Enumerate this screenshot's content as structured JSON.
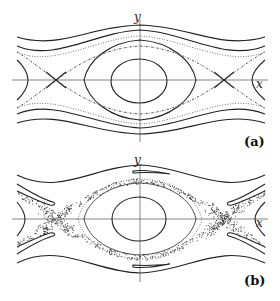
{
  "figure": {
    "panels": [
      {
        "id": "a",
        "label": "(a)",
        "x_axis_label": "x",
        "y_axis_label": "y",
        "features": [
          "central elliptic orbit",
          "separatrix with X-points",
          "rotational orbits above and below",
          "dotted near-separatrix orbits"
        ]
      },
      {
        "id": "b",
        "label": "(b)",
        "x_axis_label": "x",
        "y_axis_label": "y",
        "features": [
          "central elliptic orbit",
          "dotted invariant curve",
          "chaotic layer around separatrix",
          "stretched tongue lobes",
          "rotational orbits above and below"
        ]
      }
    ]
  },
  "colors": {
    "background": "#ffffff",
    "stroke": "#222222",
    "axis": "#555555"
  }
}
